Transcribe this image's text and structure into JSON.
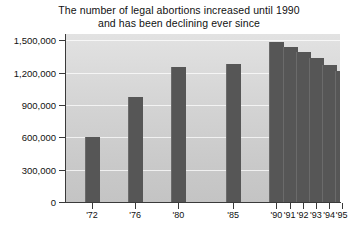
{
  "chart_data": {
    "type": "bar",
    "title": "The number of legal abortions increased until 1990 and has been declining ever since",
    "title_lines": [
      "The number of legal abortions increased until 1990",
      "and has been declining ever since"
    ],
    "xlabel": "",
    "ylabel": "",
    "categories": [
      "'72",
      "'76",
      "'80",
      "'85",
      "'90",
      "'91",
      "'92",
      "'93",
      "'94",
      "'95"
    ],
    "values": [
      600000,
      975000,
      1250000,
      1280000,
      1490000,
      1440000,
      1390000,
      1340000,
      1270000,
      1220000
    ],
    "ylim": [
      0,
      1560000
    ],
    "yticks": [
      0,
      300000,
      600000,
      900000,
      1200000,
      1500000
    ],
    "ytick_labels": [
      "0",
      "300,000",
      "600,000",
      "900,000",
      "1,200,000",
      "1,500,000"
    ],
    "grid": true,
    "legend": false,
    "legend_position": "none",
    "bar_color": "#565656",
    "plot_background": "#d4d4d4",
    "gridline_color": "#ffffff",
    "axis_color": "#3a3a3a",
    "page_background": "#ffffff"
  },
  "bars": [
    {
      "label": "'72",
      "value": 600000,
      "center_pct": 9.5,
      "width_pct": 5.1
    },
    {
      "label": "'76",
      "value": 975000,
      "center_pct": 25.2,
      "width_pct": 5.1
    },
    {
      "label": "'80",
      "value": 1250000,
      "center_pct": 41.0,
      "width_pct": 5.1
    },
    {
      "label": "'85",
      "value": 1280000,
      "center_pct": 61.0,
      "width_pct": 5.1
    },
    {
      "label": "'90",
      "value": 1490000,
      "center_pct": 76.8,
      "width_pct": 5.1
    },
    {
      "label": "'91",
      "value": 1440000,
      "center_pct": 81.6,
      "width_pct": 5.1
    },
    {
      "label": "'92",
      "value": 1390000,
      "center_pct": 86.4,
      "width_pct": 5.1
    },
    {
      "label": "'93",
      "value": 1340000,
      "center_pct": 91.2,
      "width_pct": 5.1
    },
    {
      "label": "'94",
      "value": 1270000,
      "center_pct": 96.0,
      "width_pct": 5.1
    },
    {
      "label": "'95",
      "value": 1220000,
      "center_pct": 100.6,
      "width_pct": 5.1
    }
  ]
}
